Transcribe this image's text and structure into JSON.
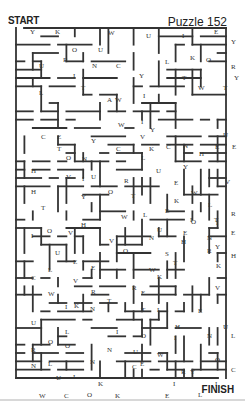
{
  "header": {
    "start_label": "START",
    "title": "Puzzle 152"
  },
  "footer": {
    "finish_label": "FINISH"
  },
  "maze": {
    "bounds": {
      "x": 16,
      "y": 28,
      "w": 210,
      "h": 350
    },
    "letters": [
      {
        "c": "Y",
        "x": 18,
        "y": 10
      },
      {
        "c": "K",
        "x": 43,
        "y": 10
      },
      {
        "c": "W",
        "x": 96,
        "y": 11
      },
      {
        "c": "U",
        "x": 134,
        "y": 14
      },
      {
        "c": "I",
        "x": 170,
        "y": 14
      },
      {
        "c": "E",
        "x": 202,
        "y": 10
      },
      {
        "c": "Y",
        "x": 219,
        "y": 20
      },
      {
        "c": "O",
        "x": 60,
        "y": 28
      },
      {
        "c": "U",
        "x": 86,
        "y": 28
      },
      {
        "c": "K",
        "x": 178,
        "y": 36
      },
      {
        "c": "O",
        "x": 194,
        "y": 38
      },
      {
        "c": "R",
        "x": 51,
        "y": 38
      },
      {
        "c": "U",
        "x": 27,
        "y": 44
      },
      {
        "c": "N",
        "x": 80,
        "y": 44
      },
      {
        "c": "C",
        "x": 104,
        "y": 44
      },
      {
        "c": "L",
        "x": 153,
        "y": 40
      },
      {
        "c": "R",
        "x": 219,
        "y": 45
      },
      {
        "c": "I",
        "x": 61,
        "y": 54
      },
      {
        "c": "Y",
        "x": 127,
        "y": 54
      },
      {
        "c": "Y",
        "x": 222,
        "y": 56
      },
      {
        "c": "T",
        "x": 170,
        "y": 56
      },
      {
        "c": "L",
        "x": 27,
        "y": 71
      },
      {
        "c": "T",
        "x": 69,
        "y": 66
      },
      {
        "c": "W",
        "x": 186,
        "y": 66
      },
      {
        "c": "T",
        "x": 211,
        "y": 66
      },
      {
        "c": "A",
        "x": 95,
        "y": 78
      },
      {
        "c": "W",
        "x": 103,
        "y": 78
      },
      {
        "c": "I",
        "x": 131,
        "y": 74
      },
      {
        "c": "W",
        "x": 106,
        "y": 103
      },
      {
        "c": "I",
        "x": 129,
        "y": 100
      },
      {
        "c": "Y",
        "x": 138,
        "y": 108
      },
      {
        "c": "C",
        "x": 29,
        "y": 115
      },
      {
        "c": "E",
        "x": 45,
        "y": 115
      },
      {
        "c": "Y",
        "x": 79,
        "y": 119
      },
      {
        "c": "V",
        "x": 128,
        "y": 115
      },
      {
        "c": "U",
        "x": 211,
        "y": 113
      },
      {
        "c": "T",
        "x": 45,
        "y": 127
      },
      {
        "c": "C",
        "x": 104,
        "y": 127
      },
      {
        "c": "K",
        "x": 137,
        "y": 127
      },
      {
        "c": "C",
        "x": 154,
        "y": 125
      },
      {
        "c": "N",
        "x": 171,
        "y": 124
      },
      {
        "c": "E",
        "x": 203,
        "y": 125
      },
      {
        "c": "E",
        "x": 220,
        "y": 125
      },
      {
        "c": "O",
        "x": 54,
        "y": 136
      },
      {
        "c": "N",
        "x": 70,
        "y": 137
      },
      {
        "c": "L",
        "x": 129,
        "y": 136
      },
      {
        "c": "H",
        "x": 187,
        "y": 132
      },
      {
        "c": "U",
        "x": 144,
        "y": 149
      },
      {
        "c": "Y",
        "x": 171,
        "y": 145
      },
      {
        "c": "H",
        "x": 19,
        "y": 149
      },
      {
        "c": "V",
        "x": 54,
        "y": 155
      },
      {
        "c": "I",
        "x": 70,
        "y": 157
      },
      {
        "c": "U",
        "x": 79,
        "y": 155
      },
      {
        "c": "R",
        "x": 112,
        "y": 159
      },
      {
        "c": "E",
        "x": 162,
        "y": 161
      },
      {
        "c": "V",
        "x": 213,
        "y": 160
      },
      {
        "c": "H",
        "x": 19,
        "y": 170
      },
      {
        "c": "Y",
        "x": 69,
        "y": 175
      },
      {
        "c": "O",
        "x": 96,
        "y": 170
      },
      {
        "c": "T",
        "x": 119,
        "y": 174
      },
      {
        "c": "W",
        "x": 179,
        "y": 171
      },
      {
        "c": "T",
        "x": 29,
        "y": 186
      },
      {
        "c": "K",
        "x": 162,
        "y": 179
      },
      {
        "c": "L",
        "x": 196,
        "y": 183
      },
      {
        "c": "W",
        "x": 109,
        "y": 195
      },
      {
        "c": "L",
        "x": 131,
        "y": 193
      },
      {
        "c": "E",
        "x": 153,
        "y": 189
      },
      {
        "c": "R",
        "x": 219,
        "y": 192
      },
      {
        "c": "O",
        "x": 179,
        "y": 200
      },
      {
        "c": "I",
        "x": 204,
        "y": 201
      },
      {
        "c": "H",
        "x": 69,
        "y": 203
      },
      {
        "c": "I",
        "x": 178,
        "y": 198
      },
      {
        "c": "T",
        "x": 202,
        "y": 198
      },
      {
        "c": "O",
        "x": 35,
        "y": 209
      },
      {
        "c": "V",
        "x": 56,
        "y": 211
      },
      {
        "c": "I",
        "x": 19,
        "y": 214
      },
      {
        "c": "N",
        "x": 137,
        "y": 216
      },
      {
        "c": "U",
        "x": 145,
        "y": 208
      },
      {
        "c": "E",
        "x": 171,
        "y": 211
      },
      {
        "c": "N",
        "x": 195,
        "y": 216
      },
      {
        "c": "E",
        "x": 219,
        "y": 211
      },
      {
        "c": "V",
        "x": 97,
        "y": 219
      },
      {
        "c": "H",
        "x": 169,
        "y": 220
      },
      {
        "c": "Y",
        "x": 203,
        "y": 225
      },
      {
        "c": "U",
        "x": 43,
        "y": 231
      },
      {
        "c": "O",
        "x": 111,
        "y": 229
      },
      {
        "c": "S",
        "x": 153,
        "y": 232
      },
      {
        "c": "R",
        "x": 195,
        "y": 229
      },
      {
        "c": "H",
        "x": 219,
        "y": 234
      },
      {
        "c": "E",
        "x": 61,
        "y": 240
      },
      {
        "c": "T",
        "x": 161,
        "y": 241
      },
      {
        "c": "L",
        "x": 36,
        "y": 248
      },
      {
        "c": "E",
        "x": 79,
        "y": 246
      },
      {
        "c": "W",
        "x": 137,
        "y": 248
      },
      {
        "c": "K",
        "x": 204,
        "y": 244
      },
      {
        "c": "C",
        "x": 19,
        "y": 256
      },
      {
        "c": "V",
        "x": 61,
        "y": 259
      },
      {
        "c": "K",
        "x": 145,
        "y": 255
      },
      {
        "c": "W",
        "x": 36,
        "y": 272
      },
      {
        "c": "R",
        "x": 79,
        "y": 270
      },
      {
        "c": "R",
        "x": 120,
        "y": 266
      },
      {
        "c": "E",
        "x": 129,
        "y": 271
      },
      {
        "c": "V",
        "x": 203,
        "y": 266
      },
      {
        "c": "I",
        "x": 53,
        "y": 285
      },
      {
        "c": "K",
        "x": 62,
        "y": 284
      },
      {
        "c": "T",
        "x": 95,
        "y": 279
      },
      {
        "c": "N",
        "x": 78,
        "y": 287
      },
      {
        "c": "T",
        "x": 129,
        "y": 288
      },
      {
        "c": "L",
        "x": 145,
        "y": 288
      },
      {
        "c": "E",
        "x": 186,
        "y": 289
      },
      {
        "c": "U",
        "x": 19,
        "y": 301
      },
      {
        "c": "U",
        "x": 211,
        "y": 305
      },
      {
        "c": "H",
        "x": 163,
        "y": 305
      },
      {
        "c": "L",
        "x": 53,
        "y": 310
      },
      {
        "c": "I",
        "x": 104,
        "y": 310
      },
      {
        "c": "O",
        "x": 129,
        "y": 314
      },
      {
        "c": "I",
        "x": 162,
        "y": 316
      },
      {
        "c": "N",
        "x": 195,
        "y": 314
      },
      {
        "c": "L",
        "x": 219,
        "y": 314
      },
      {
        "c": "O",
        "x": 36,
        "y": 320
      },
      {
        "c": "O",
        "x": 53,
        "y": 324
      },
      {
        "c": "R",
        "x": 19,
        "y": 328
      },
      {
        "c": "N",
        "x": 95,
        "y": 328
      },
      {
        "c": "U",
        "x": 121,
        "y": 330
      },
      {
        "c": "W",
        "x": 145,
        "y": 333
      },
      {
        "c": "N",
        "x": 78,
        "y": 340
      },
      {
        "c": "O",
        "x": 203,
        "y": 338
      },
      {
        "c": "C",
        "x": 120,
        "y": 345
      },
      {
        "c": "E",
        "x": 128,
        "y": 342
      },
      {
        "c": "N",
        "x": 19,
        "y": 344
      },
      {
        "c": "L",
        "x": 36,
        "y": 342
      },
      {
        "c": "R",
        "x": 169,
        "y": 350
      },
      {
        "c": "Y",
        "x": 178,
        "y": 350
      },
      {
        "c": "C",
        "x": 219,
        "y": 348
      },
      {
        "c": "U",
        "x": 44,
        "y": 356
      },
      {
        "c": "I",
        "x": 61,
        "y": 355
      },
      {
        "c": "K",
        "x": 86,
        "y": 362
      },
      {
        "c": "I",
        "x": 161,
        "y": 362
      },
      {
        "c": "I",
        "x": 203,
        "y": 362
      },
      {
        "c": "W",
        "x": 27,
        "y": 374
      },
      {
        "c": "C",
        "x": 52,
        "y": 374
      },
      {
        "c": "O",
        "x": 75,
        "y": 373
      },
      {
        "c": "K",
        "x": 103,
        "y": 374
      },
      {
        "c": "E",
        "x": 153,
        "y": 374
      },
      {
        "c": "L",
        "x": 186,
        "y": 373
      }
    ]
  }
}
